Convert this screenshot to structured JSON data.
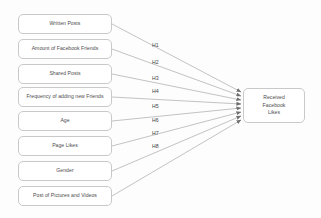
{
  "diagram": {
    "type": "path-model",
    "background_color": "#fdfdfd",
    "box_border_color": "#c9c9c9",
    "line_color": "#9a9a9a",
    "text_color": "#4a4a4a",
    "predictors": [
      {
        "id": "written-posts",
        "label": "Written Posts",
        "top": 14
      },
      {
        "id": "amount-of-facebook-friends",
        "label": "Amount of Facebook Friends",
        "top": 39
      },
      {
        "id": "shared-posts",
        "label": "Shared Posts",
        "top": 64
      },
      {
        "id": "frequency-of-adding-new-friends",
        "label": "Frequency of adding new Friends",
        "top": 87
      },
      {
        "id": "age",
        "label": "Age",
        "top": 111
      },
      {
        "id": "page-likes",
        "label": "Page Likes",
        "top": 136
      },
      {
        "id": "gender",
        "label": "Gender",
        "top": 161
      },
      {
        "id": "post-of-pictures-and-videos",
        "label": "Post of Pictures and Videos",
        "top": 186
      }
    ],
    "hypotheses": [
      {
        "id": "h1",
        "label": "H1",
        "x": 152,
        "y": 42
      },
      {
        "id": "h2",
        "label": "H2",
        "x": 152,
        "y": 59
      },
      {
        "id": "h3",
        "label": "H3",
        "x": 152,
        "y": 75
      },
      {
        "id": "h4",
        "label": "H4",
        "x": 152,
        "y": 88
      },
      {
        "id": "h5",
        "label": "H5",
        "x": 152,
        "y": 103
      },
      {
        "id": "h6",
        "label": "H6",
        "x": 152,
        "y": 117
      },
      {
        "id": "h7",
        "label": "H7",
        "x": 152,
        "y": 130
      },
      {
        "id": "h8",
        "label": "H8",
        "x": 152,
        "y": 143
      }
    ],
    "outcome": {
      "id": "received-facebook-likes",
      "line1": "Received",
      "line2": "Facebook",
      "line3": "Likes"
    },
    "connections": [
      {
        "from": "written-posts",
        "to": "received-facebook-likes",
        "hypothesis": "H1",
        "x1": 112,
        "y1": 24,
        "x2": 241,
        "y2": 92
      },
      {
        "from": "amount-of-facebook-friends",
        "to": "received-facebook-likes",
        "hypothesis": "H2",
        "x1": 112,
        "y1": 49,
        "x2": 241,
        "y2": 96
      },
      {
        "from": "shared-posts",
        "to": "received-facebook-likes",
        "hypothesis": "H3",
        "x1": 112,
        "y1": 74,
        "x2": 241,
        "y2": 100
      },
      {
        "from": "frequency-of-adding-new-friends",
        "to": "received-facebook-likes",
        "hypothesis": "H4",
        "x1": 112,
        "y1": 97,
        "x2": 241,
        "y2": 104
      },
      {
        "from": "age",
        "to": "received-facebook-likes",
        "hypothesis": "H5",
        "x1": 112,
        "y1": 121,
        "x2": 241,
        "y2": 108
      },
      {
        "from": "page-likes",
        "to": "received-facebook-likes",
        "hypothesis": "H6",
        "x1": 112,
        "y1": 146,
        "x2": 241,
        "y2": 112
      },
      {
        "from": "gender",
        "to": "received-facebook-likes",
        "hypothesis": "H7",
        "x1": 112,
        "y1": 171,
        "x2": 241,
        "y2": 116
      },
      {
        "from": "post-of-pictures-and-videos",
        "to": "received-facebook-likes",
        "hypothesis": "H8",
        "x1": 112,
        "y1": 196,
        "x2": 241,
        "y2": 120
      }
    ]
  }
}
